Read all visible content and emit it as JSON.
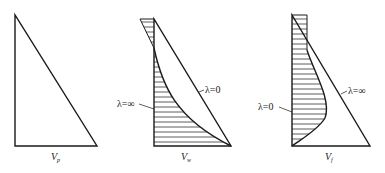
{
  "diagram": {
    "stroke_color": "#1a1a1a",
    "hatch_color": "#333333",
    "background": "#ffffff",
    "panels": [
      {
        "id": "p",
        "axis_label": "V",
        "axis_subscript": "p",
        "curves": []
      },
      {
        "id": "w",
        "axis_label": "V",
        "axis_subscript": "w",
        "curves": [
          {
            "label": "λ=∞",
            "shape": "curve",
            "hatched": true
          },
          {
            "label": "λ=0",
            "shape": "straight-line"
          }
        ]
      },
      {
        "id": "f",
        "axis_label": "V",
        "axis_subscript": "f",
        "curves": [
          {
            "label": "λ=0",
            "shape": "curve",
            "hatched": true
          },
          {
            "label": "λ=∞",
            "shape": "straight-line"
          }
        ]
      }
    ]
  }
}
